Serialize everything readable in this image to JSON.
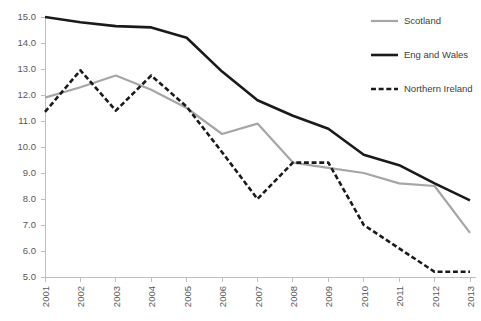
{
  "chart_data": {
    "type": "line",
    "title": "",
    "subtitle": "",
    "xlabel": "",
    "ylabel": "",
    "categories": [
      "2001",
      "2002",
      "2003",
      "2004",
      "2005",
      "2006",
      "2007",
      "2008",
      "2009",
      "2010",
      "2011",
      "2012",
      "2013"
    ],
    "x": [
      2001,
      2002,
      2003,
      2004,
      2005,
      2006,
      2007,
      2008,
      2009,
      2010,
      2011,
      2012,
      2013
    ],
    "xlim": [
      2001,
      2013
    ],
    "ylim": [
      5.0,
      15.0
    ],
    "ytick_labels": [
      "15.0",
      "14.0",
      "13.0",
      "12.0",
      "11.0",
      "10.0",
      "9.0",
      "8.0",
      "7.0",
      "6.0",
      "5.0"
    ],
    "ytick_values": [
      15.0,
      14.0,
      13.0,
      12.0,
      11.0,
      10.0,
      9.0,
      8.0,
      7.0,
      6.0,
      5.0
    ],
    "ytick_step": 1.0,
    "grid": false,
    "legend_position": "top-right",
    "series": [
      {
        "name": "Scotland",
        "style": "solid",
        "color": "#a6a6a6",
        "width": 2.2,
        "values": [
          11.9,
          12.3,
          12.75,
          12.2,
          11.5,
          10.5,
          10.9,
          9.4,
          9.2,
          9.0,
          8.6,
          8.5,
          6.7
        ]
      },
      {
        "name": "Eng and Wales",
        "style": "solid",
        "color": "#1a1a1a",
        "width": 2.6,
        "values": [
          15.0,
          14.8,
          14.65,
          14.6,
          14.2,
          12.9,
          11.8,
          11.2,
          10.7,
          9.7,
          9.3,
          8.6,
          7.95
        ]
      },
      {
        "name": "Northern Ireland",
        "style": "dashed",
        "color": "#1a1a1a",
        "width": 2.6,
        "values": [
          11.35,
          12.95,
          11.4,
          12.75,
          11.55,
          9.8,
          8.0,
          9.4,
          9.4,
          7.0,
          6.1,
          5.2,
          5.2
        ]
      }
    ],
    "legend": [
      {
        "label": "Scotland",
        "color": "#a6a6a6",
        "style": "solid"
      },
      {
        "label": "Eng and Wales",
        "color": "#1a1a1a",
        "style": "solid"
      },
      {
        "label": "Northern Ireland",
        "color": "#1a1a1a",
        "style": "dashed"
      }
    ]
  }
}
